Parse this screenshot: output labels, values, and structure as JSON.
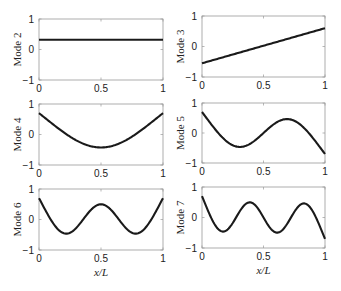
{
  "figure": {
    "line_color": "#1a1a1a",
    "axes_color": "#9a9a9a",
    "x_label": "x/L"
  },
  "chart_data": [
    {
      "type": "line",
      "title": "",
      "xlabel": "",
      "ylabel": "Mode 2",
      "xlim": [
        0,
        1
      ],
      "ylim": [
        -1,
        1
      ],
      "xticks": [
        "0",
        "0.5",
        "1"
      ],
      "yticks": [
        "-1",
        "0",
        "1"
      ],
      "grid": false,
      "kind": "rigid_translation",
      "params": {
        "value": 0.32
      },
      "x": [
        0,
        0.25,
        0.5,
        0.75,
        1
      ],
      "values": [
        0.31,
        0.31,
        0.32,
        0.32,
        0.33
      ]
    },
    {
      "type": "line",
      "title": "",
      "xlabel": "",
      "ylabel": "Mode 3",
      "xlim": [
        0,
        1
      ],
      "ylim": [
        -1,
        1
      ],
      "xticks": [
        "0",
        "0.5",
        "1"
      ],
      "yticks": [
        "-1",
        "0",
        "1"
      ],
      "grid": false,
      "kind": "rigid_rotation",
      "params": {
        "start": -0.55,
        "end": 0.6
      },
      "x": [
        0,
        0.25,
        0.5,
        0.75,
        1
      ],
      "values": [
        -0.55,
        -0.26,
        0.02,
        0.31,
        0.6
      ]
    },
    {
      "type": "line",
      "title": "",
      "xlabel": "",
      "ylabel": "Mode 4",
      "xlim": [
        0,
        1
      ],
      "ylim": [
        -1,
        1
      ],
      "xticks": [
        "0",
        "0.5",
        "1"
      ],
      "yticks": [
        "-1",
        "0",
        "1"
      ],
      "grid": false,
      "kind": "free_free_beam",
      "params": {
        "betaL": 4.73,
        "scale": 0.35,
        "sign": 1
      },
      "x": [
        0,
        0.1,
        0.2,
        0.3,
        0.4,
        0.5,
        0.6,
        0.7,
        0.8,
        0.9,
        1
      ],
      "values": [
        0.7,
        0.39,
        0.08,
        -0.2,
        -0.37,
        -0.43,
        -0.37,
        -0.2,
        0.08,
        0.39,
        0.7
      ]
    },
    {
      "type": "line",
      "title": "",
      "xlabel": "",
      "ylabel": "Mode 5",
      "xlim": [
        0,
        1
      ],
      "ylim": [
        -1,
        1
      ],
      "xticks": [
        "0",
        "0.5",
        "1"
      ],
      "yticks": [
        "-1",
        "0",
        "1"
      ],
      "grid": false,
      "kind": "free_free_beam",
      "params": {
        "betaL": 7.8532,
        "scale": 0.35,
        "sign": 1
      },
      "x": [
        0,
        0.1,
        0.2,
        0.3,
        0.4,
        0.5,
        0.6,
        0.7,
        0.8,
        0.9,
        1
      ],
      "values": [
        0.7,
        0.19,
        -0.25,
        -0.42,
        -0.26,
        0.0,
        0.26,
        0.42,
        0.25,
        -0.19,
        -0.7
      ]
    },
    {
      "type": "line",
      "title": "",
      "xlabel": "x/L",
      "ylabel": "Mode 6",
      "xlim": [
        0,
        1
      ],
      "ylim": [
        -1,
        1
      ],
      "xticks": [
        "0",
        "0.5",
        "1"
      ],
      "yticks": [
        "-1",
        "0",
        "1"
      ],
      "grid": false,
      "kind": "free_free_beam",
      "params": {
        "betaL": 10.9956,
        "scale": 0.35,
        "sign": 1
      },
      "x": [
        0,
        0.1,
        0.2,
        0.3,
        0.4,
        0.5,
        0.6,
        0.7,
        0.8,
        0.9,
        1
      ],
      "values": [
        0.7,
        0.02,
        -0.4,
        -0.22,
        0.24,
        0.43,
        0.24,
        -0.22,
        -0.4,
        0.02,
        0.7
      ]
    },
    {
      "type": "line",
      "title": "",
      "xlabel": "x/L",
      "ylabel": "Mode 7",
      "xlim": [
        0,
        1
      ],
      "ylim": [
        -1,
        1
      ],
      "xticks": [
        "0",
        "0.5",
        "1"
      ],
      "yticks": [
        "-1",
        "0",
        "1"
      ],
      "grid": false,
      "kind": "free_free_beam",
      "params": {
        "betaL": 14.1372,
        "scale": 0.35,
        "sign": 1
      },
      "x": [
        0,
        0.1,
        0.2,
        0.3,
        0.4,
        0.5,
        0.6,
        0.7,
        0.8,
        0.9,
        1
      ],
      "values": [
        0.7,
        -0.15,
        -0.4,
        0.12,
        0.42,
        0.0,
        -0.42,
        -0.12,
        0.4,
        0.15,
        -0.7
      ]
    }
  ]
}
